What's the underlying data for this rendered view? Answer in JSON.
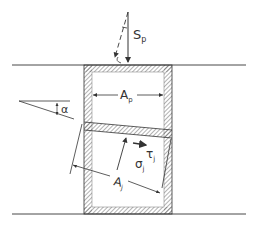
{
  "diagram": {
    "type": "mechanics-free-body",
    "labels": {
      "load": "S",
      "load_sub": "p",
      "plate_area": "A",
      "plate_area_sub": "p",
      "angle": "α",
      "joint_area": "A",
      "joint_area_sub": "j",
      "normal_stress": "σ",
      "normal_stress_sub": "j",
      "shear_stress": "τ",
      "shear_stress_sub": "j"
    },
    "colors": {
      "line": "#333333",
      "hatch": "#555555",
      "background": "#ffffff"
    }
  }
}
